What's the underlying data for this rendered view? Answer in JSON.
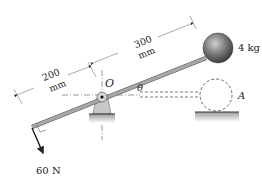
{
  "diagram": {
    "labels": {
      "dim_left_value": "200",
      "dim_left_unit": "mm",
      "dim_right_value": "300",
      "dim_right_unit": "mm",
      "pivot": "O",
      "angle": "θ",
      "mass": "4 kg",
      "position_a": "A",
      "force": "60 N"
    },
    "colors": {
      "rod": "#9a9a9a",
      "ball": "#6f6f6f",
      "line": "#333333",
      "ground": "#bdbdbd"
    }
  }
}
